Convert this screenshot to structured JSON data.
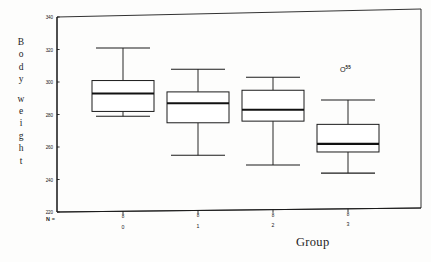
{
  "figure": {
    "ylabel": "Body weight",
    "ylabel_letters": [
      "B",
      "o",
      "d",
      "y",
      " ",
      "w",
      "e",
      "i",
      "g",
      "h",
      "t"
    ],
    "xlabel": "Group",
    "n_prefix": "N ="
  },
  "chart_data": {
    "type": "box",
    "title": "",
    "xlabel": "Group",
    "ylabel": "Body weight",
    "ylim": [
      220,
      340
    ],
    "yticks": [
      220,
      240,
      260,
      280,
      300,
      320,
      340
    ],
    "ytick_labels": [
      "220",
      "240",
      "260",
      "280",
      "300",
      "320",
      "340"
    ],
    "grid": false,
    "legend": null,
    "categories": [
      "0",
      "1",
      "2",
      "3"
    ],
    "n_counts": [
      "8",
      "8",
      "8",
      "8"
    ],
    "boxes": [
      {
        "category": "0",
        "whisker_low": 278,
        "q1": 281,
        "median": 292,
        "q3": 300,
        "whisker_high": 320,
        "outliers": []
      },
      {
        "category": "1",
        "whisker_low": 253,
        "q1": 273,
        "median": 285,
        "q3": 292,
        "whisker_high": 306,
        "outliers": []
      },
      {
        "category": "2",
        "whisker_low": 246,
        "q1": 273,
        "median": 280,
        "q3": 292,
        "whisker_high": 300,
        "outliers": []
      },
      {
        "category": "3",
        "whisker_low": 240,
        "q1": 253,
        "median": 258,
        "q3": 270,
        "whisker_high": 285,
        "outliers": [
          {
            "value": 303,
            "label": "55"
          }
        ]
      }
    ]
  }
}
